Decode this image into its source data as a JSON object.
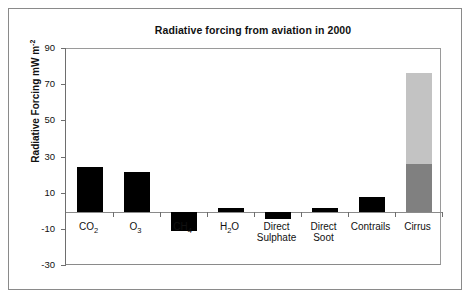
{
  "chart_data": {
    "type": "bar",
    "title": "Radiative forcing from aviation in 2000",
    "xlabel": "",
    "ylabel": "Radiative Forcing mW m",
    "ylabel_exponent": "-2",
    "ylim": [
      -30,
      90
    ],
    "yticks": [
      90,
      70,
      50,
      30,
      10,
      -10,
      -30
    ],
    "ytick_labels": [
      "90",
      "70",
      "50",
      "30",
      "10",
      "-10",
      "-30"
    ],
    "grid": false,
    "legend": "none",
    "categories": [
      "CO2",
      "O3",
      "CH4",
      "H2O",
      "Direct Sulphate",
      "Direct Soot",
      "Contrails",
      "Cirrus"
    ],
    "category_labels": [
      {
        "line1": "CO",
        "sub1": "2",
        "line2": "",
        "sub2": ""
      },
      {
        "line1": "O",
        "sub1": "3",
        "line2": "",
        "sub2": ""
      },
      {
        "line1": "CH",
        "sub1": "4",
        "line2": "",
        "sub2": ""
      },
      {
        "line1": "H",
        "sub1": "2",
        "line1b": "O",
        "line2": "",
        "sub2": ""
      },
      {
        "line1": "Direct",
        "sub1": "",
        "line2": "Sulphate",
        "sub2": ""
      },
      {
        "line1": "Direct",
        "sub1": "",
        "line2": "Soot",
        "sub2": ""
      },
      {
        "line1": "Contrails",
        "sub1": "",
        "line2": "",
        "sub2": ""
      },
      {
        "line1": "Cirrus",
        "sub1": "",
        "line2": "",
        "sub2": ""
      }
    ],
    "values": [
      25,
      22,
      -10.5,
      2,
      -4,
      2,
      8,
      77
    ],
    "series": [
      {
        "name": "Radiative forcing",
        "values": [
          25,
          22,
          -10.5,
          2,
          -4,
          2,
          8,
          77
        ],
        "colors": [
          "#000000",
          "#000000",
          "#000000",
          "#000000",
          "#000000",
          "#000000",
          "#000000",
          "#808080"
        ]
      }
    ],
    "stacked_detail": {
      "category": "Cirrus",
      "lower_value": 26.5,
      "upper_value": 77,
      "lower_color": "#808080",
      "upper_color": "#c3c3c3",
      "note": "Cirrus bar drawn as a two-tone range bar: dark grey 0-26.5, light grey 26.5-77"
    },
    "colors": {
      "bar_black": "#000000",
      "bar_grey_dark": "#808080",
      "bar_grey_light": "#c3c3c3",
      "axis": "#6e6e6e",
      "frame": "#8a8a8a",
      "text": "#111111",
      "background": "#ffffff"
    }
  }
}
